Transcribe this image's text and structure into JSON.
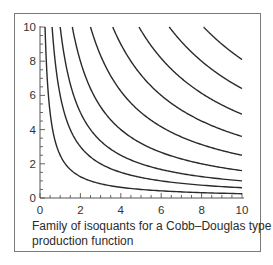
{
  "chart_data": {
    "type": "line",
    "title": "",
    "caption": [
      "Family of isoquants for a Cobb–Douglas type",
      "production function"
    ],
    "xlabel": "",
    "ylabel": "",
    "xlim": [
      0,
      10
    ],
    "ylim": [
      0,
      10
    ],
    "x_ticks": [
      0,
      2,
      4,
      6,
      8,
      10
    ],
    "y_ticks": [
      0,
      2,
      4,
      6,
      8,
      10
    ],
    "minor_tick_step": 0.5,
    "grid": false,
    "legend": null,
    "function_form": "x * y = k",
    "series": [
      {
        "name": "isoquant 1",
        "k": 2.5
      },
      {
        "name": "isoquant 2",
        "k": 6
      },
      {
        "name": "isoquant 3",
        "k": 10
      },
      {
        "name": "isoquant 4",
        "k": 16
      },
      {
        "name": "isoquant 5",
        "k": 25
      },
      {
        "name": "isoquant 6",
        "k": 36
      },
      {
        "name": "isoquant 7",
        "k": 49
      },
      {
        "name": "isoquant 8",
        "k": 64
      },
      {
        "name": "isoquant 9",
        "k": 81
      }
    ],
    "line_color": "#2a2a2a"
  }
}
